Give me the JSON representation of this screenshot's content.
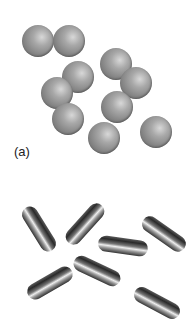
{
  "figure": {
    "panel_a_label": "(a)",
    "spheres": [
      {
        "x": 38,
        "y": 41,
        "r": 16
      },
      {
        "x": 69,
        "y": 41,
        "r": 16
      },
      {
        "x": 116,
        "y": 64,
        "r": 16
      },
      {
        "x": 78,
        "y": 77,
        "r": 16
      },
      {
        "x": 136,
        "y": 83,
        "r": 16
      },
      {
        "x": 57,
        "y": 93,
        "r": 16
      },
      {
        "x": 117,
        "y": 107,
        "r": 16
      },
      {
        "x": 68,
        "y": 119,
        "r": 16
      },
      {
        "x": 104,
        "y": 138,
        "r": 16
      },
      {
        "x": 156,
        "y": 132,
        "r": 16
      }
    ],
    "rods": [
      {
        "x": 39,
        "y": 229,
        "angle": 58
      },
      {
        "x": 85,
        "y": 224,
        "angle": -48
      },
      {
        "x": 123,
        "y": 246,
        "angle": 8
      },
      {
        "x": 164,
        "y": 234,
        "angle": 35
      },
      {
        "x": 97,
        "y": 271,
        "angle": 25
      },
      {
        "x": 50,
        "y": 283,
        "angle": -30
      },
      {
        "x": 157,
        "y": 303,
        "angle": 28
      }
    ]
  }
}
